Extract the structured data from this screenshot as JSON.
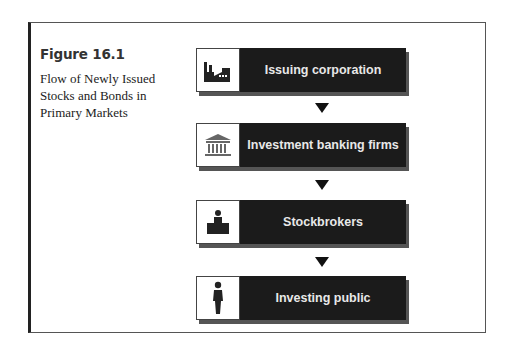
{
  "figure": {
    "number": "Figure 16.1",
    "title": "Flow of Newly Issued Stocks and Bonds in Primary Markets"
  },
  "steps": [
    {
      "label": "Issuing corporation",
      "icon": "factory-icon"
    },
    {
      "label": "Investment banking firms",
      "icon": "bank-building-icon"
    },
    {
      "label": "Stockbrokers",
      "icon": "person-at-desk-icon"
    },
    {
      "label": "Investing public",
      "icon": "person-icon"
    }
  ],
  "connectors": [
    "down-arrow",
    "down-arrow",
    "down-arrow"
  ],
  "colors": {
    "box_fill": "#1b1b1b",
    "box_text": "#e8e8e8",
    "frame": "#555555"
  }
}
